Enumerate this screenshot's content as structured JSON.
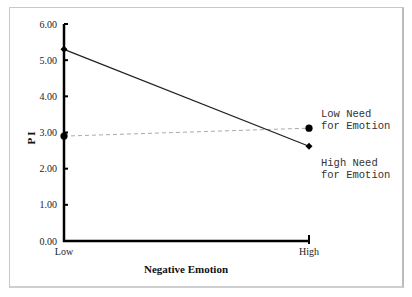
{
  "chart_data": {
    "type": "line",
    "title": "",
    "xlabel": "Negative Emotion",
    "ylabel": "P I",
    "categories": [
      "Low",
      "High"
    ],
    "ylim": [
      0,
      6
    ],
    "yticks": [
      "0.00",
      "1.00",
      "2.00",
      "3.00",
      "4.00",
      "5.00",
      "6.00"
    ],
    "grid": false,
    "legend_position": "right, inline labels",
    "series": [
      {
        "name": "Low Need for Emotion",
        "values": [
          2.9,
          3.12
        ],
        "line_style": "dashed",
        "color": "#aaaaaa",
        "marker": "circle"
      },
      {
        "name": "High Need for Emotion",
        "values": [
          5.3,
          2.62
        ],
        "line_style": "solid",
        "color": "#222222",
        "marker": "diamond"
      }
    ]
  },
  "legend": {
    "low": [
      "Low Need",
      "for Emotion"
    ],
    "high": [
      "High Need",
      "for Emotion"
    ]
  }
}
